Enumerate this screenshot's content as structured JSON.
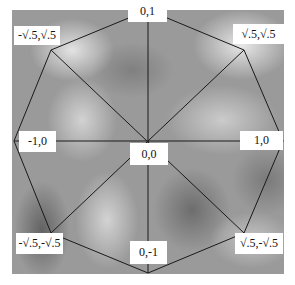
{
  "diagram": {
    "title": "",
    "type": "octagon-unit-circle-points",
    "center_label": "0,0",
    "vertices": [
      {
        "id": "top",
        "label": "0,1"
      },
      {
        "id": "top-right",
        "label": "√.5,√.5"
      },
      {
        "id": "right",
        "label": "1,0"
      },
      {
        "id": "bottom-right",
        "label": "√.5,-√.5"
      },
      {
        "id": "bottom",
        "label": "0,-1"
      },
      {
        "id": "bottom-left",
        "label": "-√.5,-√.5"
      },
      {
        "id": "left",
        "label": "-1,0"
      },
      {
        "id": "top-left",
        "label": "-√.5,√.5"
      }
    ],
    "colors": {
      "line": "#1a1a1a",
      "label_bg": "#ffffff",
      "label_text": "#111111"
    }
  }
}
